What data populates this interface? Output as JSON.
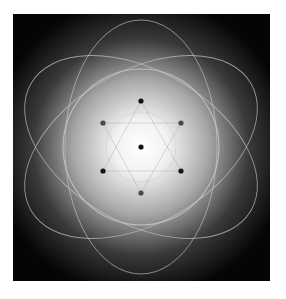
{
  "figure": {
    "colors": {
      "page_background": "#ffffff",
      "panel_background": "#050505",
      "glow_center": "#ffffff",
      "glow_mid": "#8a8a8a",
      "line_color": "#c8c8c8",
      "dot_dark": "#141414",
      "dot_grey": "#4a4a4a"
    },
    "center": [
      141,
      147
    ],
    "ellipses": [
      {
        "rx": 76,
        "ry": 127,
        "rotation": 0
      },
      {
        "rx": 76,
        "ry": 127,
        "rotation": 60
      },
      {
        "rx": 76,
        "ry": 127,
        "rotation": 120
      }
    ],
    "circles": [
      {
        "r": 78,
        "role": "outer-circle"
      },
      {
        "r": 35,
        "role": "inner-circle"
      }
    ],
    "dots": [
      {
        "x": 141,
        "y": 101,
        "tone": "dark"
      },
      {
        "x": 103,
        "y": 123,
        "tone": "grey"
      },
      {
        "x": 181,
        "y": 123,
        "tone": "grey"
      },
      {
        "x": 141,
        "y": 147,
        "tone": "dark"
      },
      {
        "x": 103,
        "y": 171,
        "tone": "dark"
      },
      {
        "x": 181,
        "y": 171,
        "tone": "dark"
      },
      {
        "x": 141,
        "y": 193,
        "tone": "grey"
      }
    ]
  }
}
